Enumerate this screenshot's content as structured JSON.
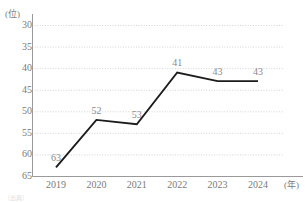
{
  "chart_data": {
    "type": "line",
    "title": "",
    "subtitle": "",
    "xlabel": "(年)",
    "ylabel": "(位)",
    "categories": [
      "2019",
      "2020",
      "2021",
      "2022",
      "2023",
      "2024"
    ],
    "x": [
      2019,
      2020,
      2021,
      2022,
      2023,
      2024
    ],
    "values": [
      63,
      52,
      53,
      41,
      43,
      43
    ],
    "series": [
      {
        "name": "順位",
        "values": [
          63,
          52,
          53,
          41,
          43,
          43
        ]
      }
    ],
    "data_labels": [
      "63",
      "52",
      "53",
      "41",
      "43",
      "43"
    ],
    "ylim": [
      30,
      65
    ],
    "y_inverted": true,
    "y_ticks": [
      30,
      35,
      40,
      45,
      50,
      55,
      60,
      65
    ],
    "y_tick_labels": [
      "30",
      "35",
      "40",
      "45",
      "50",
      "55",
      "60",
      "65"
    ],
    "x_ticks": [
      2019,
      2020,
      2021,
      2022,
      2023,
      2024
    ],
    "x_tick_labels": [
      "2019",
      "2020",
      "2021",
      "2022",
      "2023",
      "2024"
    ],
    "grid": true,
    "grid_style": "dotted",
    "legend": false,
    "legend_position": "none",
    "line_color": "#1c1c1c",
    "grid_color": "#c8c8d2",
    "axis_color": "#9a9a9a",
    "label_color": "#7a7a7a",
    "value_label_color": "#8a8a8a",
    "background_color": "#ffffff"
  },
  "axis": {
    "y_unit": "(位)",
    "x_unit": "(年)"
  },
  "caption": {
    "text": "（出典）"
  }
}
